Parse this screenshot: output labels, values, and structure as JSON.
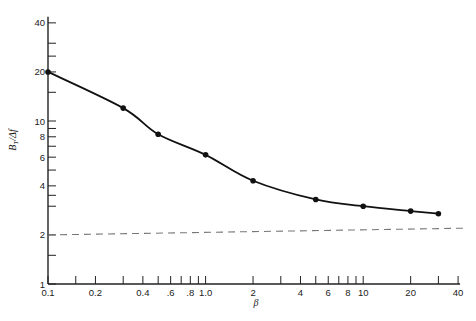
{
  "chart_data": {
    "type": "line",
    "title": "",
    "xlabel": "β",
    "ylabel": "B_T / Δf",
    "x_scale": "log",
    "y_scale": "log",
    "xlim": [
      0.1,
      40
    ],
    "ylim": [
      1,
      40
    ],
    "grid": false,
    "x_tick_labels": [
      "0.1",
      "0.2",
      "0.4",
      ".6",
      ".8",
      "1.0",
      "2",
      "4",
      "6",
      "8",
      "10",
      "20",
      "40"
    ],
    "x_tick_values": [
      0.1,
      0.2,
      0.4,
      0.6,
      0.8,
      1.0,
      2,
      4,
      6,
      8,
      10,
      20,
      40
    ],
    "x_minor_ticks": [
      0.15,
      0.3,
      0.5,
      0.7,
      0.9,
      3,
      5,
      7,
      9,
      30
    ],
    "y_tick_labels": [
      "1",
      "2",
      "4",
      "6",
      "8",
      "10",
      "20",
      "40"
    ],
    "y_tick_values": [
      1,
      2,
      4,
      6,
      8,
      10,
      20,
      40
    ],
    "y_minor_ticks": [
      1.5,
      3,
      3.5,
      5,
      7,
      9,
      15,
      25,
      30
    ],
    "series": [
      {
        "name": "Measured bandwidth (points + smooth curve)",
        "style": "solid line with dot markers",
        "x": [
          0.1,
          0.3,
          0.5,
          1.0,
          2,
          5,
          10,
          20,
          30
        ],
        "y": [
          20,
          12,
          8.3,
          6.2,
          4.3,
          3.3,
          3.0,
          2.8,
          2.7
        ]
      },
      {
        "name": "Reference (dashed)",
        "style": "dashed line, no markers",
        "x": [
          0.1,
          40
        ],
        "y": [
          2.0,
          2.2
        ]
      }
    ],
    "caption_partial": "…bandwidth for FM…"
  }
}
